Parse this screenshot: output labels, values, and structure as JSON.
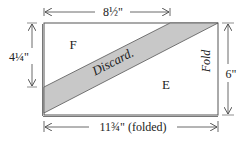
{
  "diagram": {
    "regions": {
      "top_left_label": "F",
      "bottom_right_label": "E",
      "discard_label": "Discard.",
      "fold_label": "Fold"
    },
    "dimensions": {
      "top": "8½\"",
      "left": "4¼\"",
      "right": "6\"",
      "bottom": "11¾\" (folded)"
    },
    "colors": {
      "outline": "#555555",
      "discard_fill": "#c8c8c8",
      "text": "#222222",
      "arrow": "#444444"
    }
  }
}
